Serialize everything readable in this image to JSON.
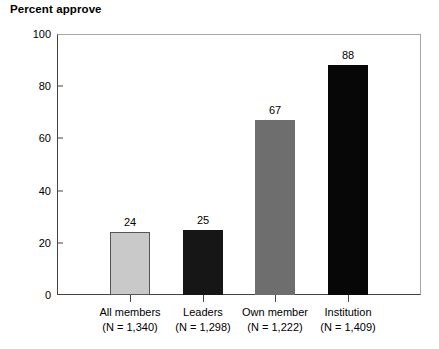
{
  "chart_data": {
    "type": "bar",
    "title": "Percent approve",
    "xlabel": "",
    "ylabel": "",
    "ylim": [
      0,
      100
    ],
    "yticks": [
      0,
      20,
      40,
      60,
      80,
      100
    ],
    "grid": false,
    "legend": "none",
    "categories": [
      "All members",
      "Leaders",
      "Own member",
      "Institution"
    ],
    "category_sublabels": [
      "(N = 1,340)",
      "(N = 1,298)",
      "(N = 1,222)",
      "(N = 1,409)"
    ],
    "sample_sizes": [
      1340,
      1298,
      1222,
      1409
    ],
    "values": [
      24,
      25,
      67,
      88
    ],
    "value_labels": [
      "24",
      "25",
      "67",
      "88"
    ],
    "bar_colors": [
      "#c9c9c9",
      "#161616",
      "#6e6e6e",
      "#070707"
    ],
    "bar_border_colors": [
      "#555555",
      "#161616",
      "#6e6e6e",
      "#070707"
    ],
    "axis_color": "#444444",
    "frame_color": "#a8a8a8",
    "background": "#ffffff"
  }
}
